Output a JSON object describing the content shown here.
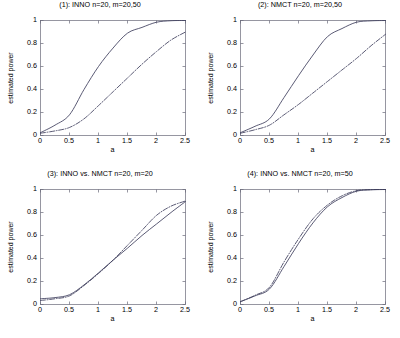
{
  "figure": {
    "background": "#ffffff",
    "line_color": "#3d3d5c",
    "axis_color": "#6a6a7a"
  },
  "axes": {
    "xlabel": "a",
    "ylabel": "estimated power",
    "xticks": [
      "0",
      "0.5",
      "1",
      "1.5",
      "2",
      "2.5"
    ],
    "yticks": [
      "0",
      "0.2",
      "0.4",
      "0.6",
      "0.8",
      "1"
    ],
    "xlim": [
      0,
      2.5
    ],
    "ylim": [
      0,
      1
    ]
  },
  "chart_data": [
    {
      "type": "line",
      "title": "(1): INNO n=20, m=20,50",
      "xlabel": "a",
      "ylabel": "estimated power",
      "xlim": [
        0,
        2.5
      ],
      "ylim": [
        0,
        1
      ],
      "grid": false,
      "legend": "none",
      "x": [
        0,
        0.25,
        0.5,
        0.75,
        1,
        1.25,
        1.5,
        1.75,
        2,
        2.25,
        2.5
      ],
      "series": [
        {
          "name": "m=20 (solid)",
          "style": "solid",
          "values": [
            0.025,
            0.09,
            0.18,
            0.4,
            0.6,
            0.76,
            0.89,
            0.94,
            0.985,
            0.998,
            1.0
          ]
        },
        {
          "name": "m=50 (dash-dot)",
          "style": "dash-dot",
          "values": [
            0.02,
            0.04,
            0.07,
            0.145,
            0.26,
            0.38,
            0.5,
            0.62,
            0.73,
            0.83,
            0.9
          ]
        }
      ]
    },
    {
      "type": "line",
      "title": "(2): NMCT n=20, m=20,50",
      "xlabel": "a",
      "ylabel": "estimated power",
      "xlim": [
        0,
        2.5
      ],
      "ylim": [
        0,
        1
      ],
      "grid": false,
      "legend": "none",
      "x": [
        0,
        0.25,
        0.5,
        0.75,
        1,
        1.25,
        1.5,
        1.75,
        2,
        2.25,
        2.5
      ],
      "series": [
        {
          "name": "m=20 (solid)",
          "style": "solid",
          "values": [
            0.025,
            0.08,
            0.145,
            0.33,
            0.52,
            0.7,
            0.86,
            0.93,
            0.985,
            0.997,
            1.0
          ]
        },
        {
          "name": "m=50 (dash-dot)",
          "style": "dash-dot",
          "values": [
            0.02,
            0.05,
            0.09,
            0.18,
            0.27,
            0.37,
            0.47,
            0.57,
            0.67,
            0.78,
            0.88
          ]
        }
      ]
    },
    {
      "type": "line",
      "title": "(3): INNO vs. NMCT n=20, m=20",
      "xlabel": "a",
      "ylabel": "estimated power",
      "xlim": [
        0,
        2.5
      ],
      "ylim": [
        0,
        1
      ],
      "grid": false,
      "legend": "none",
      "x": [
        0,
        0.25,
        0.5,
        0.75,
        1,
        1.25,
        1.5,
        1.75,
        2,
        2.25,
        2.5
      ],
      "series": [
        {
          "name": "INNO (solid)",
          "style": "solid",
          "values": [
            0.05,
            0.06,
            0.085,
            0.17,
            0.275,
            0.385,
            0.49,
            0.6,
            0.7,
            0.8,
            0.895
          ]
        },
        {
          "name": "NMCT (dash-dot)",
          "style": "dash-dot",
          "values": [
            0.035,
            0.05,
            0.075,
            0.165,
            0.27,
            0.385,
            0.515,
            0.645,
            0.775,
            0.855,
            0.9
          ]
        }
      ]
    },
    {
      "type": "line",
      "title": "(4): INNO vs. NMCT n=20, m=50",
      "xlabel": "a",
      "ylabel": "estimated power",
      "xlim": [
        0,
        2.5
      ],
      "ylim": [
        0,
        1
      ],
      "grid": false,
      "legend": "none",
      "x": [
        0,
        0.25,
        0.5,
        0.75,
        1,
        1.25,
        1.5,
        1.75,
        2,
        2.25,
        2.5
      ],
      "series": [
        {
          "name": "INNO (solid)",
          "style": "solid",
          "values": [
            0.025,
            0.075,
            0.135,
            0.33,
            0.53,
            0.71,
            0.85,
            0.93,
            0.985,
            0.997,
            1.0
          ]
        },
        {
          "name": "NMCT (dash-dot)",
          "style": "dash-dot",
          "values": [
            0.025,
            0.08,
            0.15,
            0.37,
            0.57,
            0.745,
            0.865,
            0.945,
            0.99,
            0.999,
            1.0
          ]
        }
      ]
    }
  ]
}
